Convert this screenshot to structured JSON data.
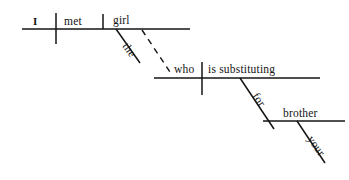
{
  "diagram": {
    "type": "reed-kellogg-sentence-diagram",
    "sentence": "I met the girl who is substituting for your brother.",
    "ink_color": "#141414",
    "background_color": "#ffffff",
    "labels": {
      "subject": "I",
      "verb": "met",
      "direct_object": "girl",
      "object_article": "the",
      "relative_pronoun": "who",
      "relative_verb": "is substituting",
      "preposition": "for",
      "prep_object": "brother",
      "prep_object_modifier": "your"
    },
    "lines": {
      "baseline_main": "main clause baseline",
      "baseline_relative": "relative clause baseline",
      "baseline_prepositional": "prepositional phrase baseline",
      "divider_subject_verb": "vertical line crossing baseline between subject and verb",
      "divider_verb_object": "short vertical line on baseline between verb and direct object",
      "divider_relative_subject_verb": "vertical line crossing relative clause baseline",
      "modifier_the": "slanted line under girl",
      "modifier_your": "slanted line under brother",
      "connector_preposition": "slanted line from relative verb down to prepositional baseline",
      "connector_relative": "dashed line linking girl to who"
    }
  }
}
